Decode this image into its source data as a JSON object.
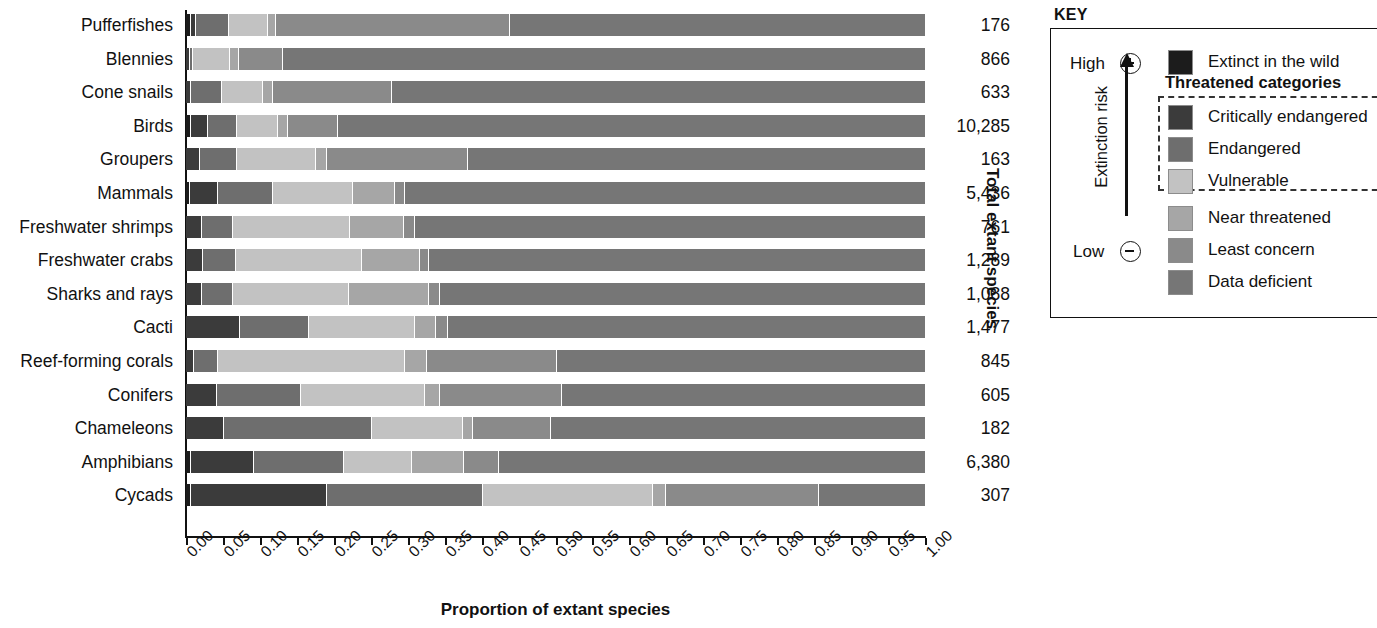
{
  "chart_data": {
    "type": "bar",
    "subtype": "stacked-horizontal-100-percent",
    "title": "",
    "xlabel": "Proportion of extant species",
    "ylabel": "",
    "right_axis_label": "Total extant species",
    "xlim": [
      0,
      1
    ],
    "grid": false,
    "legend_position": "right",
    "tick_labels": [
      "0.00",
      "0.05",
      "0.10",
      "0.15",
      "0.20",
      "0.25",
      "0.30",
      "0.35",
      "0.40",
      "0.45",
      "0.50",
      "0.55",
      "0.60",
      "0.65",
      "0.70",
      "0.75",
      "0.80",
      "0.85",
      "0.90",
      "0.95",
      "1.00"
    ],
    "tick_values": [
      0,
      0.05,
      0.1,
      0.15,
      0.2,
      0.25,
      0.3,
      0.35,
      0.4,
      0.45,
      0.5,
      0.55,
      0.6,
      0.65,
      0.7,
      0.75,
      0.8,
      0.85,
      0.9,
      0.95,
      1.0
    ],
    "series": [
      {
        "name": "Extinct in the wild",
        "key": "EW",
        "color": "#1c1c1c"
      },
      {
        "name": "Critically endangered",
        "key": "CR",
        "color": "#3b3b3b"
      },
      {
        "name": "Endangered",
        "key": "EN",
        "color": "#6e6e6e"
      },
      {
        "name": "Vulnerable",
        "key": "VU",
        "color": "#c2c2c2"
      },
      {
        "name": "Near threatened",
        "key": "NT",
        "color": "#a6a6a6"
      },
      {
        "name": "Least concern",
        "key": "LC",
        "color": "#8a8a8a"
      },
      {
        "name": "Data deficient",
        "key": "DD",
        "color": "#767676"
      }
    ],
    "categories": [
      "Pufferfishes",
      "Blennies",
      "Cone snails",
      "Birds",
      "Groupers",
      "Mammals",
      "Freshwater shrimps",
      "Freshwater crabs",
      "Sharks and rays",
      "Cacti",
      "Reef-forming corals",
      "Conifers",
      "Chameleons",
      "Amphibians",
      "Cycads"
    ],
    "totals": [
      "176",
      "866",
      "633",
      "10,285",
      "163",
      "5,436",
      "761",
      "1,289",
      "1,088",
      "1,477",
      "845",
      "605",
      "182",
      "6,380",
      "307"
    ],
    "rows": [
      {
        "category": "Pufferfishes",
        "total": "176",
        "values": {
          "EW": 0.006,
          "CR": 0.006,
          "EN": 0.045,
          "VU": 0.052,
          "NT": 0.012,
          "LC": 0.316,
          "DD": 0.563
        }
      },
      {
        "category": "Blennies",
        "total": "866",
        "values": {
          "EW": 0.0,
          "CR": 0.004,
          "EN": 0.004,
          "VU": 0.05,
          "NT": 0.012,
          "LC": 0.06,
          "DD": 0.87
        }
      },
      {
        "category": "Cone snails",
        "total": "633",
        "values": {
          "EW": 0.0,
          "CR": 0.006,
          "EN": 0.042,
          "VU": 0.055,
          "NT": 0.014,
          "LC": 0.16,
          "DD": 0.723
        }
      },
      {
        "category": "Birds",
        "total": "10,285",
        "values": {
          "EW": 0.005,
          "CR": 0.023,
          "EN": 0.04,
          "VU": 0.055,
          "NT": 0.013,
          "LC": 0.069,
          "DD": 0.795
        }
      },
      {
        "category": "Groupers",
        "total": "163",
        "values": {
          "EW": 0.0,
          "CR": 0.018,
          "EN": 0.05,
          "VU": 0.106,
          "NT": 0.016,
          "LC": 0.19,
          "DD": 0.62
        }
      },
      {
        "category": "Mammals",
        "total": "5,436",
        "values": {
          "EW": 0.004,
          "CR": 0.038,
          "EN": 0.074,
          "VU": 0.108,
          "NT": 0.058,
          "LC": 0.013,
          "DD": 0.705
        }
      },
      {
        "category": "Freshwater shrimps",
        "total": "761",
        "values": {
          "EW": 0.0,
          "CR": 0.02,
          "EN": 0.042,
          "VU": 0.158,
          "NT": 0.073,
          "LC": 0.016,
          "DD": 0.691
        }
      },
      {
        "category": "Freshwater crabs",
        "total": "1,289",
        "values": {
          "EW": 0.0,
          "CR": 0.022,
          "EN": 0.044,
          "VU": 0.171,
          "NT": 0.078,
          "LC": 0.013,
          "DD": 0.672
        }
      },
      {
        "category": "Sharks and rays",
        "total": "1,088",
        "values": {
          "EW": 0.0,
          "CR": 0.02,
          "EN": 0.042,
          "VU": 0.157,
          "NT": 0.108,
          "LC": 0.015,
          "DD": 0.658
        }
      },
      {
        "category": "Cacti",
        "total": "1,477",
        "values": {
          "EW": 0.0,
          "CR": 0.072,
          "EN": 0.093,
          "VU": 0.143,
          "NT": 0.029,
          "LC": 0.016,
          "DD": 0.647
        }
      },
      {
        "category": "Reef-forming corals",
        "total": "845",
        "values": {
          "EW": 0.0,
          "CR": 0.01,
          "EN": 0.032,
          "VU": 0.253,
          "NT": 0.03,
          "LC": 0.175,
          "DD": 0.5
        }
      },
      {
        "category": "Conifers",
        "total": "605",
        "values": {
          "EW": 0.0,
          "CR": 0.04,
          "EN": 0.114,
          "VU": 0.168,
          "NT": 0.02,
          "LC": 0.165,
          "DD": 0.493
        }
      },
      {
        "category": "Chameleons",
        "total": "182",
        "values": {
          "EW": 0.0,
          "CR": 0.05,
          "EN": 0.2,
          "VU": 0.123,
          "NT": 0.014,
          "LC": 0.105,
          "DD": 0.508
        }
      },
      {
        "category": "Amphibians",
        "total": "6,380",
        "values": {
          "EW": 0.005,
          "CR": 0.085,
          "EN": 0.122,
          "VU": 0.093,
          "NT": 0.07,
          "LC": 0.047,
          "DD": 0.578
        }
      },
      {
        "category": "Cycads",
        "total": "307",
        "values": {
          "EW": 0.005,
          "CR": 0.185,
          "EN": 0.21,
          "VU": 0.23,
          "NT": 0.018,
          "LC": 0.207,
          "DD": 0.145
        }
      }
    ]
  },
  "key": {
    "title": "KEY",
    "risk_axis_label": "Extinction risk",
    "high_label": "High",
    "low_label": "Low",
    "high_symbol": "+",
    "low_symbol": "−",
    "threatened_heading": "Threatened categories",
    "items": [
      {
        "label": "Extinct in the wild",
        "color": "#1c1c1c"
      },
      {
        "label": "Critically endangered",
        "color": "#3b3b3b"
      },
      {
        "label": "Endangered",
        "color": "#6e6e6e"
      },
      {
        "label": "Vulnerable",
        "color": "#c2c2c2"
      },
      {
        "label": "Near threatened",
        "color": "#a6a6a6"
      },
      {
        "label": "Least concern",
        "color": "#8a8a8a"
      },
      {
        "label": "Data deficient",
        "color": "#767676"
      }
    ]
  }
}
